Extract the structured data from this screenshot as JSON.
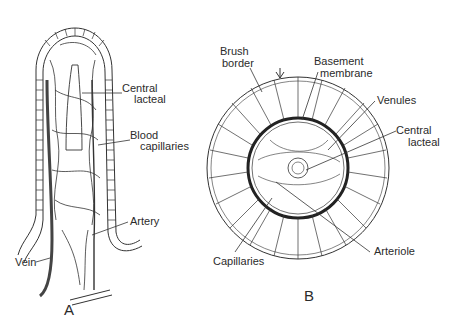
{
  "figure": {
    "panel_a": {
      "letter": "A",
      "labels": {
        "central_lacteal_1": "Central",
        "central_lacteal_2": "lacteal",
        "blood_capillaries_1": "Blood",
        "blood_capillaries_2": "capillaries",
        "artery": "Artery",
        "vein": "Vein"
      }
    },
    "panel_b": {
      "letter": "B",
      "labels": {
        "brush_border_1": "Brush",
        "brush_border_2": "border",
        "basement_membrane_1": "Basement",
        "basement_membrane_2": "membrane",
        "venules": "Venules",
        "central_lacteal_1": "Central",
        "central_lacteal_2": "lacteal",
        "arteriole": "Arteriole",
        "capillaries": "Capillaries"
      }
    },
    "colors": {
      "ink": "#2b2b2b",
      "background": "#ffffff"
    }
  }
}
